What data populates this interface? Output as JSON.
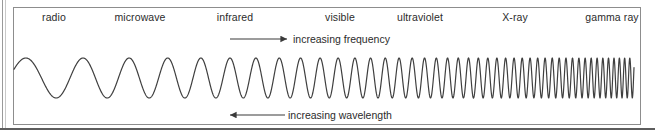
{
  "figure": {
    "type": "electromagnetic-spectrum-diagram",
    "bands": [
      {
        "label": "radio",
        "x": 54
      },
      {
        "label": "microwave",
        "x": 140
      },
      {
        "label": "infrared",
        "x": 235
      },
      {
        "label": "visible",
        "x": 340
      },
      {
        "label": "ultraviolet",
        "x": 420
      },
      {
        "label": "X-ray",
        "x": 515
      },
      {
        "label": "gamma ray",
        "x": 612
      }
    ],
    "annotations": {
      "frequency": {
        "text": "increasing frequency",
        "direction": "right",
        "arrow_x1": 230,
        "arrow_x2": 287,
        "arrow_y": 39
      },
      "wavelength": {
        "text": "increasing wavelength",
        "direction": "left",
        "arrow_x1": 285,
        "arrow_x2": 230,
        "arrow_y": 115
      }
    },
    "wave": {
      "x_start": 14,
      "x_end": 634,
      "centerline_y": 78,
      "amplitude": 20,
      "wavelength_start": 68,
      "wavelength_end": 5,
      "stroke": "#3f3f3f",
      "stroke_width": 1.2
    },
    "colors": {
      "background": "#ffffff",
      "frame": "#8d8d8d",
      "text": "#2b2b2b",
      "rule": "#5d5d5d"
    }
  }
}
